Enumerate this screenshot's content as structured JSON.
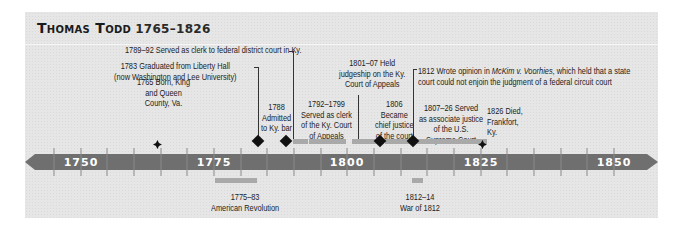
{
  "title": {
    "name": "Thomas Todd",
    "years": "1765–1826"
  },
  "axis": {
    "labels": [
      "1750",
      "1775",
      "1800",
      "1825",
      "1850"
    ],
    "color": "#6f6f6f"
  },
  "events": {
    "born": {
      "lines": [
        "1765 Born, King",
        "and Queen",
        "County, Va."
      ]
    },
    "graduated": {
      "lines": [
        "1783 Graduated from Liberty Hall",
        "(now Washington and Lee University)"
      ]
    },
    "clerk_federal": {
      "text": "1789–92 Served as clerk to federal district court in Ky."
    },
    "admitted": {
      "lines": [
        "1788",
        "Admitted",
        "to Ky. bar"
      ]
    },
    "clerk_appeals": {
      "lines": [
        "1792–1799",
        "Served as clerk",
        "of the Ky. Court",
        "of Appeals"
      ]
    },
    "judgeship": {
      "lines": [
        "1801–07 Held",
        "judgeship on the Ky.",
        "Court of Appeals"
      ]
    },
    "chief_justice": {
      "lines": [
        "1806",
        "Became",
        "chief justice",
        "of the court"
      ]
    },
    "mckim": {
      "prefix": "1812 Wrote opinion in ",
      "case": "McKim v. Voorhies",
      "suffix": ", which held that a state",
      "line2": "court could not enjoin the judgment of a federal circuit court"
    },
    "associate": {
      "lines": [
        "1807–26  Served",
        "as associate justice",
        "of the U.S.",
        "Supreme Court"
      ]
    },
    "died": {
      "lines": [
        "1826 Died,",
        "Frankfort,",
        "Ky."
      ]
    }
  },
  "context": {
    "revolution": {
      "years": "1775–83",
      "label": "American Revolution"
    },
    "war1812": {
      "years": "1812–14",
      "label": "War of 1812"
    }
  }
}
